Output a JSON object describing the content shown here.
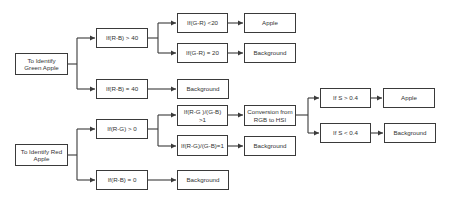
{
  "diagram": {
    "nodes": {
      "green_start": "To Identify Green Apple",
      "rb_gt_40": "If(R-B) > 40",
      "rb_eq_40": "If(R-B) = 40",
      "gr_lt_20": "If(G-R) <20",
      "gr_eq_20": "If(G-R) = 20",
      "green_apple": "Apple",
      "green_bg1": "Background",
      "green_bg2": "Background",
      "red_start": "To Identify Red Apple",
      "rg_gt_0": "If(R-G) > 0",
      "rb_eq_0": "If(R-B) = 0",
      "ratio_gt_1": "If(R-G )/(G-B) >1",
      "ratio_eq_1": "If(R-G)/(G-B)=1",
      "convert": "Conversion from RGB to HSI",
      "red_bg1": "Background",
      "red_bg2": "Background",
      "s_gt": "If S > 0.4",
      "s_lt": "If S < 0.4",
      "red_apple": "Apple",
      "red_bg3": "Background"
    },
    "edges": [
      [
        "green_start",
        "rb_gt_40"
      ],
      [
        "green_start",
        "rb_eq_40"
      ],
      [
        "rb_gt_40",
        "gr_lt_20"
      ],
      [
        "rb_gt_40",
        "gr_eq_20"
      ],
      [
        "gr_lt_20",
        "green_apple"
      ],
      [
        "gr_eq_20",
        "green_bg1"
      ],
      [
        "rb_eq_40",
        "green_bg2"
      ],
      [
        "red_start",
        "rg_gt_0"
      ],
      [
        "red_start",
        "rb_eq_0"
      ],
      [
        "rg_gt_0",
        "ratio_gt_1"
      ],
      [
        "rg_gt_0",
        "ratio_eq_1"
      ],
      [
        "ratio_gt_1",
        "convert"
      ],
      [
        "ratio_eq_1",
        "red_bg1"
      ],
      [
        "rb_eq_0",
        "red_bg2"
      ],
      [
        "convert",
        "s_gt"
      ],
      [
        "convert",
        "s_lt"
      ],
      [
        "s_gt",
        "red_apple"
      ],
      [
        "s_lt",
        "red_bg3"
      ]
    ],
    "colors": {
      "line": "#3a3a3a",
      "text": "#333333",
      "background": "#ffffff"
    }
  }
}
